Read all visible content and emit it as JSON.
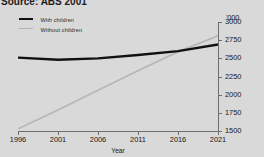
{
  "source": {
    "text": "Source: ABS 2001"
  },
  "legend": {
    "position": "top-left",
    "items": [
      {
        "label": "With children",
        "key": "with_children",
        "color": "#111111"
      },
      {
        "label": "Without children",
        "key": "without_children",
        "color": "#b6b6b6"
      }
    ]
  },
  "axes": {
    "y_unit": "'000",
    "y_ticks": [
      "3000",
      "2750",
      "2500",
      "2250",
      "2000",
      "1750",
      "1500"
    ],
    "x_ticks": [
      "1996",
      "2001",
      "2006",
      "2011",
      "2016",
      "2021"
    ],
    "x_title": "Year"
  },
  "chart_data": {
    "type": "line",
    "title": "",
    "subtitle": "",
    "xlabel": "Year",
    "ylabel": "'000",
    "xlim": [
      1996,
      2021
    ],
    "ylim": [
      1500,
      3000
    ],
    "yticks": [
      1500,
      1750,
      2000,
      2250,
      2500,
      2750,
      3000
    ],
    "xticks": [
      1996,
      2001,
      2006,
      2011,
      2016,
      2021
    ],
    "grid": false,
    "legend_position": "top-left",
    "y_axis_side": "right",
    "x": [
      1996,
      2001,
      2006,
      2011,
      2016,
      2021
    ],
    "series": [
      {
        "name": "With children",
        "color": "#111111",
        "width": 2.4,
        "values": [
          2510,
          2480,
          2500,
          2545,
          2600,
          2690
        ]
      },
      {
        "name": "Without children",
        "color": "#b6b6b6",
        "width": 1.7,
        "values": [
          1530,
          1790,
          2060,
          2330,
          2590,
          2810
        ]
      }
    ]
  }
}
